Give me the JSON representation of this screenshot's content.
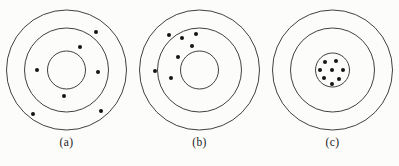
{
  "figure": {
    "background_color": "#fcfcfb",
    "stroke_color": "#2b2b2b",
    "dot_color": "#151515"
  },
  "chart_data": {
    "type": "scatter",
    "title": "",
    "subtitle": "",
    "xlabel": "",
    "ylabel": "",
    "grid": false,
    "legend": "none",
    "panels": [
      {
        "id": "a",
        "label": "(a)",
        "center": {
          "x": 66.5,
          "y": 70
        },
        "rings": [
          {
            "name": "outer-ring",
            "r": 60
          },
          {
            "name": "middle-ring",
            "r": 42
          },
          {
            "name": "inner-ring",
            "r": 19
          }
        ],
        "dot_radius": 2.0,
        "dot_count": 7,
        "points": [
          {
            "x": 96,
            "y": 32
          },
          {
            "x": 80,
            "y": 47
          },
          {
            "x": 37,
            "y": 70
          },
          {
            "x": 98,
            "y": 72
          },
          {
            "x": 64,
            "y": 96
          },
          {
            "x": 33,
            "y": 114
          },
          {
            "x": 101,
            "y": 111
          }
        ]
      },
      {
        "id": "b",
        "label": "(b)",
        "center": {
          "x": 66.5,
          "y": 70
        },
        "rings": [
          {
            "name": "outer-ring",
            "r": 60
          },
          {
            "name": "middle-ring",
            "r": 42
          },
          {
            "name": "inner-ring",
            "r": 19
          }
        ],
        "dot_radius": 2.0,
        "dot_count": 7,
        "points": [
          {
            "x": 36,
            "y": 35
          },
          {
            "x": 49,
            "y": 38
          },
          {
            "x": 59,
            "y": 46
          },
          {
            "x": 63,
            "y": 34
          },
          {
            "x": 45,
            "y": 57
          },
          {
            "x": 22,
            "y": 71
          },
          {
            "x": 38,
            "y": 78
          }
        ]
      },
      {
        "id": "c",
        "label": "(c)",
        "center": {
          "x": 66.5,
          "y": 70
        },
        "rings": [
          {
            "name": "outer-ring",
            "r": 60
          },
          {
            "name": "middle-ring",
            "r": 42
          },
          {
            "name": "inner-ring",
            "r": 17
          }
        ],
        "dot_radius": 2.0,
        "dot_count": 8,
        "points": [
          {
            "x": 59,
            "y": 62
          },
          {
            "x": 70,
            "y": 61
          },
          {
            "x": 54,
            "y": 70
          },
          {
            "x": 66,
            "y": 70
          },
          {
            "x": 77,
            "y": 70
          },
          {
            "x": 58,
            "y": 78
          },
          {
            "x": 73,
            "y": 79
          },
          {
            "x": 66,
            "y": 84
          }
        ]
      }
    ]
  }
}
